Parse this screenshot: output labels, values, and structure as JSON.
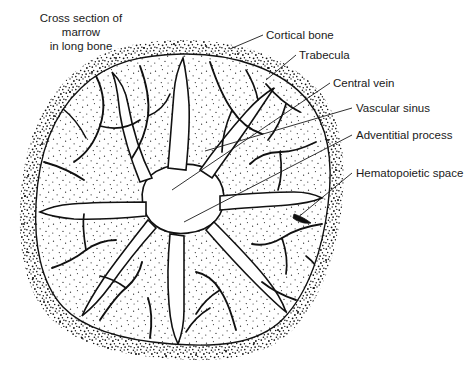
{
  "figure": {
    "title_lines": [
      "Cross section of",
      "marrow",
      "in long bone"
    ],
    "title_line_1": "Cross section of",
    "title_line_2": "marrow",
    "title_line_3": "in long bone",
    "background_color": "#ffffff",
    "ink_color": "#1a1a1a",
    "stipple_color": "#111111"
  },
  "callouts": [
    {
      "id": "cortical-bone",
      "label": "Cortical bone"
    },
    {
      "id": "trabecula",
      "label": "Trabecula"
    },
    {
      "id": "central-vein",
      "label": "Central vein"
    },
    {
      "id": "vascular-sinus",
      "label": "Vascular sinus"
    },
    {
      "id": "adventitial-process",
      "label": "Adventitial process"
    },
    {
      "id": "hematopoietic-space",
      "label": "Hematopoietic space"
    }
  ],
  "labels": {
    "cortical_bone": "Cortical bone",
    "trabecula": "Trabecula",
    "central_vein": "Central vein",
    "vascular_sinus": "Vascular sinus",
    "adventitial_process": "Adventitial process",
    "hematopoietic_space": "Hematopoietic space"
  }
}
